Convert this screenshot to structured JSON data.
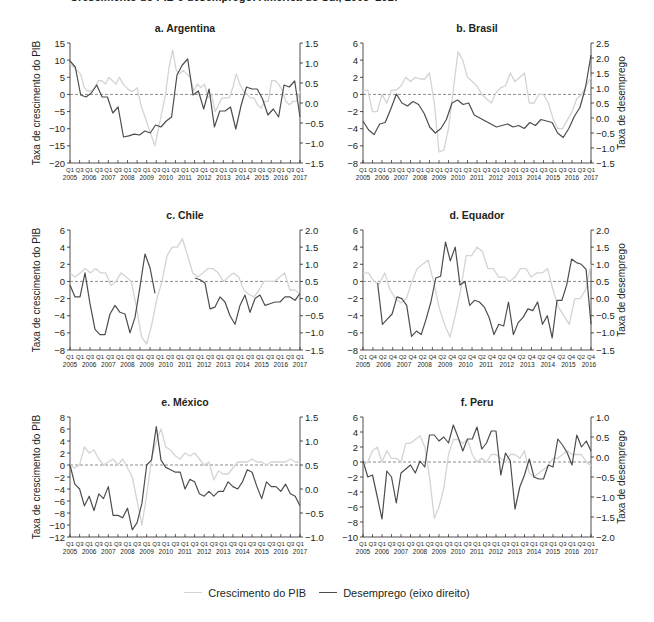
{
  "page": {
    "top_title_partial": "Crescimento do PIB e desemprego: América do Sul, 2005–2017"
  },
  "legend": {
    "gdp_label": "Crescimento do PIB",
    "unemp_label": "Desemprego (eixo direito)",
    "gdp_color": "#d4d4d4",
    "unemp_color": "#4d4d4f"
  },
  "chart_data": [
    {
      "type": "line",
      "title": "a. Argentina",
      "ylabel": "Taxa de crescimento do PIB",
      "ylabel_right": "",
      "ylim": [
        -20,
        15
      ],
      "yticks": [
        15,
        10,
        5,
        0,
        -5,
        -10,
        -15,
        -20
      ],
      "ylim_right": [
        -1.5,
        1.5
      ],
      "yticks_right": [
        "1.5",
        "1.0",
        "0.5",
        "0.0",
        "-0.5",
        "-1.0",
        "-1.5"
      ],
      "xtick_quarters": [
        "Q1",
        "Q3",
        "Q1",
        "Q3",
        "Q1",
        "Q3",
        "Q1",
        "Q3",
        "Q1",
        "Q3",
        "Q1",
        "Q3",
        "Q1",
        "Q3",
        "Q1",
        "Q3",
        "Q1",
        "Q3",
        "Q1",
        "Q3",
        "Q1",
        "Q3",
        "Q1",
        "Q3",
        "Q1"
      ],
      "xtick_years": [
        "2005",
        "2006",
        "2007",
        "2008",
        "2009",
        "2010",
        "2011",
        "2012",
        "2013",
        "2014",
        "2015",
        "2016",
        "2017"
      ],
      "series": [
        {
          "name": "Crescimento do PIB",
          "axis": "left",
          "values": [
            9,
            8,
            7,
            6,
            2,
            1,
            1,
            2,
            4,
            4,
            3,
            5,
            4,
            3,
            5,
            3,
            2,
            1,
            1,
            2,
            -3,
            -6,
            -9,
            -12,
            -15,
            -10,
            -5,
            0,
            8,
            13,
            7,
            6,
            7,
            6,
            5,
            1,
            3,
            2,
            3,
            -1,
            0,
            -5,
            -3,
            -1,
            -1,
            -1,
            2,
            6,
            3,
            1,
            0,
            -1,
            -1,
            -3,
            -4,
            -2,
            -2,
            4,
            4,
            3,
            1,
            -2,
            -3,
            -2,
            -2,
            1
          ]
        },
        {
          "name": "Desemprego (eixo direito)",
          "axis": "right",
          "values": [
            1.05,
            0.9,
            0.2,
            0.15,
            0.25,
            0.45,
            0.15,
            0.15,
            -0.25,
            -0.1,
            -0.85,
            -0.82,
            -0.78,
            -0.8,
            -0.7,
            -0.75,
            -0.55,
            -0.6,
            -0.45,
            -0.35,
            0.7,
            0.95,
            1.1,
            0.2,
            0.3,
            -0.15,
            0.35,
            -0.6,
            -0.2,
            -0.2,
            -0.1,
            -0.65,
            -0.05,
            0.4,
            0.35,
            0.35,
            0.1,
            -0.3,
            -0.15,
            -0.35,
            0.45,
            0.4,
            0.55,
            -0.35
          ]
        }
      ]
    },
    {
      "type": "line",
      "title": "b. Brasil",
      "ylabel": "",
      "ylabel_right": "Taxa de desemprego",
      "ylim": [
        -8,
        6
      ],
      "yticks": [
        6,
        4,
        2,
        0,
        -2,
        -4,
        -6,
        -8
      ],
      "ylim_right": [
        -1.5,
        2.5
      ],
      "yticks_right": [
        "2.5",
        "2.0",
        "1.5",
        "1.0",
        "0.5",
        "0.0",
        "-0.5",
        "-1.0",
        "-1.5"
      ],
      "xtick_quarters": [
        "Q1",
        "Q3",
        "Q1",
        "Q3",
        "Q1",
        "Q3",
        "Q1",
        "Q3",
        "Q1",
        "Q3",
        "Q1",
        "Q3",
        "Q1",
        "Q3",
        "Q1",
        "Q3",
        "Q1",
        "Q3",
        "Q1",
        "Q3",
        "Q1",
        "Q3",
        "Q1",
        "Q3",
        "Q1"
      ],
      "xtick_years": [
        "2005",
        "2006",
        "2007",
        "2008",
        "2009",
        "2010",
        "2011",
        "2012",
        "2013",
        "2014",
        "2015",
        "2016",
        "2017"
      ],
      "series": [
        {
          "name": "Crescimento do PIB",
          "axis": "left",
          "values": [
            0.5,
            0.5,
            -2,
            -2,
            0,
            -1,
            0.5,
            0.5,
            1,
            2,
            1.5,
            2,
            1.8,
            1.8,
            2.5,
            -1,
            -6.7,
            -6.5,
            -4,
            0.5,
            5,
            4,
            2,
            1.5,
            1,
            0,
            -0.5,
            -1,
            0.2,
            0.8,
            1,
            2.5,
            1.5,
            2,
            2.5,
            -1,
            -1,
            0,
            0,
            -1,
            -2.8,
            -4,
            -4,
            -3,
            -2,
            -0.5,
            0,
            1,
            2
          ]
        },
        {
          "name": "Desemprego (eixo direito)",
          "axis": "right",
          "values": [
            -0.1,
            -0.4,
            -0.55,
            -0.2,
            -0.15,
            0.3,
            0.8,
            0.5,
            0.4,
            0.55,
            0.45,
            0.15,
            -0.3,
            -0.5,
            -0.35,
            -0.05,
            0.5,
            0.6,
            0.45,
            0.5,
            0.1,
            0.0,
            -0.1,
            -0.2,
            -0.3,
            -0.25,
            -0.2,
            -0.3,
            -0.25,
            -0.35,
            -0.15,
            -0.25,
            -0.05,
            -0.1,
            -0.15,
            -0.5,
            -0.65,
            -0.35,
            0.05,
            0.35,
            1.0,
            2.1
          ]
        }
      ]
    },
    {
      "type": "line",
      "title": "c. Chile",
      "ylabel": "Taxa de crescimento do PIB",
      "ylabel_right": "",
      "ylim": [
        -8,
        6
      ],
      "yticks": [
        6,
        4,
        2,
        0,
        -2,
        -4,
        -6,
        -8
      ],
      "ylim_right": [
        -1.5,
        2.0
      ],
      "yticks_right": [
        "2.0",
        "1.5",
        "1.0",
        "0.5",
        "0.0",
        "-0.5",
        "-1.0",
        "-1.5"
      ],
      "xtick_quarters": [
        "Q1",
        "Q1",
        "Q3",
        "Q1",
        "Q3",
        "Q1",
        "Q3",
        "Q1",
        "Q3",
        "Q1",
        "Q3",
        "Q1",
        "Q3",
        "Q1",
        "Q3",
        "Q1",
        "Q3",
        "Q1",
        "Q3",
        "Q1",
        "Q3",
        "Q1",
        "Q3",
        "Q1"
      ],
      "xtick_years": [
        "2005",
        "2006",
        "2007",
        "2008",
        "2009",
        "2010",
        "2011",
        "2012",
        "2013",
        "2014",
        "2015",
        "2016",
        "2017"
      ],
      "series": [
        {
          "name": "Crescimento do PIB",
          "axis": "left",
          "values": [
            1,
            0.5,
            1,
            1.5,
            1,
            1.5,
            1,
            1,
            -0.5,
            0,
            1,
            0.5,
            0,
            -3,
            -6.5,
            -7.3,
            -5,
            -2,
            0,
            3,
            4,
            4,
            5,
            3,
            1,
            0.5,
            1,
            1.5,
            1.5,
            1,
            0,
            0.5,
            1,
            0.5,
            -1,
            -1.5,
            -1.8,
            -1,
            0,
            0,
            0,
            0.5,
            1,
            -1,
            -1,
            -1.5
          ]
        },
        {
          "name": "Desemprego (eixo direito)",
          "axis": "right",
          "values": [
            0.4,
            0.05,
            0.05,
            0.75,
            -0.15,
            -0.9,
            -1.05,
            -1.05,
            -0.45,
            -0.2,
            -0.4,
            -0.45,
            -1.0,
            -0.55,
            0.35,
            1.3,
            0.9,
            0.15,
            null,
            null,
            null,
            null,
            null,
            null,
            null,
            0.6,
            0.55,
            0.45,
            -0.3,
            -0.25,
            0.05,
            -0.1,
            -0.5,
            -0.75,
            -0.2,
            0.1,
            -0.4,
            0.0,
            0.1,
            -0.2,
            -0.15,
            -0.1,
            -0.1,
            0.05,
            0.05,
            -0.05,
            0.15
          ]
        }
      ]
    },
    {
      "type": "line",
      "title": "d. Equador",
      "ylabel": "",
      "ylabel_right": "Taxa de desemprego",
      "ylim": [
        -8,
        6
      ],
      "yticks": [
        6,
        4,
        2,
        0,
        -2,
        -4,
        -6,
        -8
      ],
      "ylim_right": [
        -1.5,
        2.0
      ],
      "yticks_right": [
        "2.0",
        "1.5",
        "1.0",
        "0.5",
        "0.0",
        "-0.5",
        "-1.0",
        "-1.5"
      ],
      "xtick_quarters": [
        "Q1",
        "Q4",
        "Q2",
        "Q4",
        "Q2",
        "Q4",
        "Q2",
        "Q4",
        "Q2",
        "Q4",
        "Q2",
        "Q4",
        "Q2",
        "Q4",
        "Q2",
        "Q4",
        "Q2",
        "Q4",
        "Q2",
        "Q4",
        "Q2",
        "Q4",
        "Q2",
        "Q4"
      ],
      "xtick_years": [
        "2005",
        "2006",
        "2007",
        "2008",
        "2009",
        "2010",
        "2011",
        "2012",
        "2013",
        "2014",
        "2015",
        "2016"
      ],
      "series": [
        {
          "name": "Crescimento do PIB",
          "axis": "left",
          "values": [
            1,
            1,
            0,
            -0.3,
            1,
            -1,
            -2,
            -2.5,
            -2,
            0,
            1.5,
            2,
            2.5,
            0,
            -3,
            -5,
            -6.5,
            -4,
            -1,
            3,
            3,
            4,
            3.5,
            1.5,
            1.5,
            0.5,
            0.5,
            0,
            0.5,
            1.5,
            1.5,
            0.5,
            1,
            1,
            1.5,
            -1,
            -3,
            -4,
            -5,
            -2,
            -2,
            -1,
            2
          ]
        },
        {
          "name": "Desemprego (eixo direito)",
          "axis": "right",
          "values": [
            null,
            null,
            null,
            0.45,
            -0.75,
            -0.6,
            -0.45,
            0.05,
            0.0,
            -0.2,
            -1.1,
            -0.95,
            -1.05,
            -0.6,
            -0.1,
            0.6,
            0.65,
            1.65,
            1.1,
            1.5,
            0.4,
            0.5,
            -0.2,
            -0.05,
            -0.1,
            -0.25,
            -0.55,
            -1.05,
            -0.75,
            -0.8,
            -0.1,
            -1.05,
            -0.7,
            -0.55,
            -0.3,
            -0.35,
            -0.1,
            -0.75,
            -0.5,
            -1.15,
            -0.05,
            -0.05,
            0.4,
            1.15,
            1.05,
            1.0,
            0.85,
            -0.75
          ]
        }
      ]
    },
    {
      "type": "line",
      "title": "e. México",
      "ylabel": "Taxa de crescimento do PIB",
      "ylabel_right": "",
      "ylim": [
        -12,
        8
      ],
      "yticks": [
        8,
        6,
        4,
        2,
        0,
        -2,
        -4,
        -6,
        -8,
        -10,
        -12
      ],
      "ylim_right": [
        -1.0,
        1.5
      ],
      "yticks_right": [
        "1.5",
        "1.0",
        "0.5",
        "0.0",
        "-0.5",
        "-1.0"
      ],
      "xtick_quarters": [
        "Q1",
        "Q3",
        "Q1",
        "Q3",
        "Q1",
        "Q3",
        "Q1",
        "Q3",
        "Q1",
        "Q3",
        "Q1",
        "Q3",
        "Q1",
        "Q3",
        "Q1",
        "Q3",
        "Q1",
        "Q3",
        "Q1",
        "Q3",
        "Q1",
        "Q3",
        "Q1",
        "Q3",
        "Q1"
      ],
      "xtick_years": [
        "2005",
        "2006",
        "2007",
        "2008",
        "2009",
        "2010",
        "2011",
        "2012",
        "2013",
        "2014",
        "2015",
        "2016",
        "2017"
      ],
      "series": [
        {
          "name": "Crescimento do PIB",
          "axis": "left",
          "values": [
            0,
            -0.5,
            0,
            3,
            2,
            2.5,
            1,
            0,
            0.5,
            1,
            0,
            1,
            -0.5,
            -2,
            -6,
            -10,
            -5,
            1,
            4,
            6,
            3,
            2.5,
            1.5,
            1,
            2,
            1.5,
            2,
            1,
            0,
            0.5,
            -2.5,
            -1,
            -1.5,
            -1.5,
            -0.5,
            0.5,
            0.5,
            0.5,
            1,
            0.5,
            0.5,
            0,
            0.5,
            0.5,
            0.5,
            0.5,
            1,
            0.5,
            0.5
          ]
        },
        {
          "name": "Desemprego (eixo direito)",
          "axis": "right",
          "values": [
            0.5,
            0.1,
            0.0,
            -0.35,
            -0.15,
            -0.45,
            -0.1,
            -0.2,
            0.05,
            -0.55,
            -0.55,
            -0.6,
            -0.4,
            -0.85,
            -0.7,
            -0.3,
            0.5,
            0.6,
            1.3,
            0.6,
            0.45,
            0.4,
            0.35,
            0.35,
            0.0,
            0.2,
            0.15,
            -0.1,
            -0.15,
            -0.05,
            -0.15,
            -0.05,
            -0.05,
            0.15,
            0.05,
            0.0,
            0.15,
            0.4,
            0.35,
            0.05,
            -0.2,
            0.15,
            0.05,
            0.05,
            -0.05,
            0.1,
            -0.1,
            -0.15,
            -0.35
          ]
        }
      ]
    },
    {
      "type": "line",
      "title": "f. Peru",
      "ylabel": "",
      "ylabel_right": "Taxa de desemprego",
      "ylim": [
        -10,
        6
      ],
      "yticks": [
        6,
        4,
        2,
        0,
        -2,
        -4,
        -6,
        -8,
        -10
      ],
      "ylim_right": [
        -2.0,
        1.0
      ],
      "yticks_right": [
        "1.0",
        "0.5",
        "0.0",
        "-0.5",
        "-1.0",
        "-1.5",
        "-2.0"
      ],
      "xtick_quarters": [
        "Q1",
        "Q3",
        "Q1",
        "Q3",
        "Q1",
        "Q3",
        "Q1",
        "Q3",
        "Q1",
        "Q3",
        "Q1",
        "Q3",
        "Q1",
        "Q3",
        "Q1",
        "Q3",
        "Q1",
        "Q3",
        "Q1",
        "Q3",
        "Q1",
        "Q3",
        "Q1",
        "Q3",
        "Q1"
      ],
      "xtick_years": [
        "2005",
        "2006",
        "2007",
        "2008",
        "2009",
        "2010",
        "2011",
        "2012",
        "2013",
        "2014",
        "2015",
        "2016",
        "2017"
      ],
      "series": [
        {
          "name": "Crescimento do PIB",
          "axis": "left",
          "values": [
            -0.5,
            0,
            1.5,
            2,
            0,
            1.5,
            0.5,
            0.5,
            0,
            2.5,
            2.5,
            3,
            3.5,
            2,
            -2,
            -7.5,
            -6,
            -3.5,
            1,
            3,
            3,
            2.5,
            3,
            1,
            0,
            0.5,
            0,
            1,
            1,
            0.5,
            0,
            1,
            1,
            0.5,
            1.5,
            -1.5,
            -2,
            -1.5,
            -1,
            -0.5,
            0.5,
            0.5,
            1,
            1.5,
            1,
            1,
            1,
            0,
            -0.5
          ]
        },
        {
          "name": "Desemprego (eixo direito)",
          "axis": "right",
          "values": [
            -0.1,
            -0.5,
            -0.45,
            -1.0,
            -1.55,
            -0.35,
            -0.5,
            -1.15,
            -0.4,
            -0.3,
            -0.2,
            -0.4,
            -0.1,
            -0.25,
            0.55,
            0.55,
            0.4,
            0.5,
            0.35,
            0.8,
            0.5,
            0.15,
            0.45,
            0.45,
            0.75,
            0.2,
            0.35,
            0.65,
            0.65,
            -0.45,
            0.1,
            -0.1,
            -1.3,
            -0.75,
            -0.45,
            -0.05,
            -0.5,
            -0.55,
            -0.55,
            -0.2,
            -0.25,
            0.45,
            0.3,
            0.1,
            -0.2,
            0.55,
            0.25,
            0.4,
            0.15
          ]
        }
      ]
    }
  ]
}
